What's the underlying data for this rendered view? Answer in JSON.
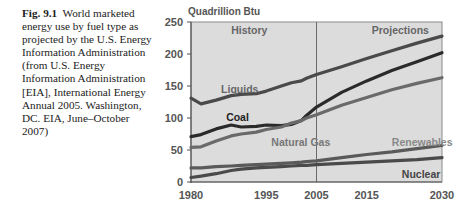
{
  "caption": {
    "label": "Fig. 9.1",
    "text": "World marketed energy use by fuel type as projected by the U.S. Energy Information Administration (from U.S. Energy Information Administration [EIA], International Energy Annual 2005. Washington, DC. EIA, June–October 2007)"
  },
  "chart_data": {
    "type": "line",
    "title": "",
    "ylabel": "Quadrillion Btu",
    "xlabel": "",
    "ylim": [
      0,
      250
    ],
    "xlim": [
      1980,
      2030
    ],
    "yticks": [
      0,
      50,
      100,
      150,
      200,
      250
    ],
    "xticks": [
      1980,
      1995,
      2005,
      2015,
      2030
    ],
    "grid": false,
    "annotations": [
      {
        "text": "History",
        "x": 1988,
        "y": 238
      },
      {
        "text": "Projections",
        "x": 2016,
        "y": 238
      },
      {
        "text": "Liquids",
        "x": 1986,
        "y": 145
      },
      {
        "text": "Coal",
        "x": 1987,
        "y": 102
      },
      {
        "text": "Natural Gas",
        "x": 1996,
        "y": 62
      },
      {
        "text": "Renewables",
        "x": 2020,
        "y": 62
      },
      {
        "text": "Nuclear",
        "x": 2022,
        "y": 12
      }
    ],
    "divider_year": 2005,
    "x": [
      1980,
      1982,
      1985,
      1988,
      1990,
      1993,
      1995,
      1998,
      2000,
      2002,
      2003,
      2005,
      2010,
      2015,
      2020,
      2025,
      2030
    ],
    "series": [
      {
        "name": "Liquids",
        "color": "#4a4a4a",
        "values": [
          131,
          122,
          128,
          135,
          137,
          138,
          142,
          150,
          155,
          158,
          162,
          168,
          180,
          193,
          205,
          217,
          228
        ]
      },
      {
        "name": "Coal",
        "color": "#2a2a2a",
        "values": [
          71,
          74,
          83,
          89,
          86,
          87,
          89,
          88,
          90,
          96,
          104,
          117,
          140,
          158,
          174,
          188,
          202
        ]
      },
      {
        "name": "Natural Gas",
        "color": "#6a6a6a",
        "values": [
          54,
          55,
          64,
          72,
          75,
          78,
          82,
          86,
          92,
          96,
          100,
          105,
          120,
          132,
          144,
          154,
          163
        ]
      },
      {
        "name": "Renewables",
        "color": "#5a5a5a",
        "values": [
          22,
          22,
          24,
          25,
          26,
          27,
          28,
          29,
          30,
          31,
          32,
          33,
          38,
          43,
          47,
          52,
          57
        ]
      },
      {
        "name": "Nuclear",
        "color": "#4a4a4a",
        "values": [
          7,
          9,
          13,
          18,
          20,
          22,
          23,
          24,
          25,
          26,
          26,
          27,
          29,
          31,
          33,
          35,
          38
        ]
      }
    ]
  }
}
